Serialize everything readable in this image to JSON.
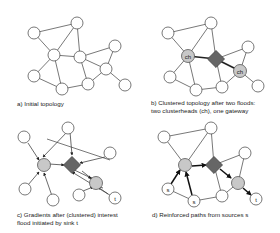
{
  "captions": {
    "a": "a) Initial topology",
    "b_line1": "b) Clustered topology after two floods:",
    "b_line2": "two clusterheads (ch), one gateway",
    "c_line1": "c) Gradients after (clustered) interest",
    "c_line2": "flood initiated by sink t",
    "d": "d) Reinforced paths from sources s"
  },
  "labels": {
    "clusterhead": "ch",
    "sink": "t",
    "source": "s"
  },
  "colors": {
    "node_fill": "#ffffff",
    "node_stroke": "#555555",
    "clusterhead_fill": "#c8c8c8",
    "gateway_fill": "#666666",
    "edge": "#555555",
    "strong_edge": "#222222"
  }
}
